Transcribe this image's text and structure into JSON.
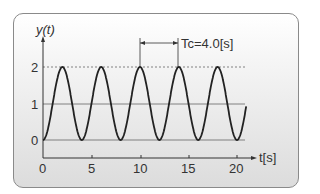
{
  "chart_data": {
    "type": "line",
    "title": "",
    "xlabel": "t[s]",
    "ylabel": "y(t)",
    "xlim": [
      0,
      21
    ],
    "ylim": [
      0,
      2
    ],
    "x_ticks": [
      "0",
      "5",
      "10",
      "15",
      "20"
    ],
    "y_ticks": [
      "0",
      "1",
      "2"
    ],
    "grid": false,
    "reference_lines": [
      {
        "y": 2,
        "style": "dashed"
      },
      {
        "y": 1,
        "style": "solid"
      },
      {
        "y": 0,
        "style": "solid"
      }
    ],
    "series": [
      {
        "name": "y(t)",
        "formula": "1 - cos(2*pi*t/4.0)",
        "x": [
          0,
          2,
          4,
          6,
          8,
          10,
          12,
          14,
          16,
          18,
          20,
          21
        ],
        "values": [
          0,
          2,
          0,
          2,
          0,
          2,
          0,
          2,
          0,
          2,
          0,
          1
        ]
      }
    ],
    "annotations": [
      {
        "text": "Tc=4.0[s]",
        "type": "period-arrow",
        "from_t": 10,
        "to_t": 14
      }
    ]
  },
  "labels": {
    "ylabel": "y(t)",
    "xlabel": "t[s]",
    "period": "Tc=4.0[s]",
    "ytick0": "0",
    "ytick1": "1",
    "ytick2": "2",
    "xtick0": "0",
    "xtick5": "5",
    "xtick10": "10",
    "xtick15": "15",
    "xtick20": "20"
  }
}
